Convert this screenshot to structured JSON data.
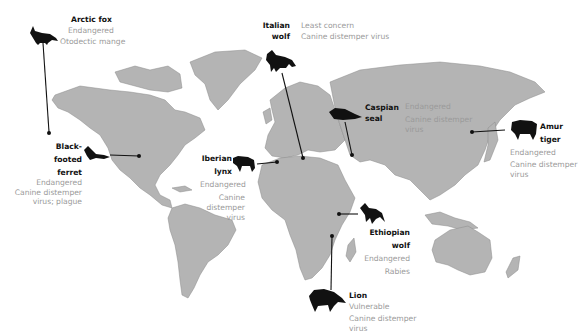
{
  "map": {
    "land_color": "#b4b4b4",
    "border_color": "#8a8a8a",
    "ink_color": "#111111",
    "muted_text_color": "#9a9a9a"
  },
  "species": [
    {
      "id": "arctic-fox",
      "name": "Arctic fox",
      "name_lines": [
        "Arctic fox"
      ],
      "status": "Endangered",
      "disease_lines": [
        "Otodectic mange"
      ],
      "icon": "fox-silhouette-icon"
    },
    {
      "id": "italian-wolf",
      "name": "Italian wolf",
      "name_lines": [
        "Italian",
        "wolf"
      ],
      "status": "Least concern",
      "disease_lines": [
        "Canine distemper virus"
      ],
      "icon": "wolf-silhouette-icon"
    },
    {
      "id": "caspian-seal",
      "name": "Caspian seal",
      "name_lines": [
        "Caspian",
        "seal"
      ],
      "status": "Endangered",
      "disease_lines": [
        "Canine distemper",
        "virus"
      ],
      "icon": "seal-silhouette-icon"
    },
    {
      "id": "amur-tiger",
      "name": "Amur tiger",
      "name_lines": [
        "Amur",
        "tiger"
      ],
      "status": "Endangered",
      "disease_lines": [
        "Canine distemper",
        "virus"
      ],
      "icon": "tiger-silhouette-icon"
    },
    {
      "id": "black-footed-ferret",
      "name": "Black-footed ferret",
      "name_lines": [
        "Black-",
        "footed",
        "ferret"
      ],
      "status": "Endangered",
      "disease_lines": [
        "Canine distemper",
        "virus; plague"
      ],
      "icon": "ferret-silhouette-icon"
    },
    {
      "id": "iberian-lynx",
      "name": "Iberian lynx",
      "name_lines": [
        "Iberian",
        "lynx"
      ],
      "status": "Endangered",
      "disease_lines": [
        "Canine",
        "distemper",
        "virus"
      ],
      "icon": "lynx-silhouette-icon"
    },
    {
      "id": "ethiopian-wolf",
      "name": "Ethiopian wolf",
      "name_lines": [
        "Ethiopian",
        "wolf"
      ],
      "status": "Endangered",
      "disease_lines": [
        "Rabies"
      ],
      "icon": "wolf-silhouette-icon"
    },
    {
      "id": "lion",
      "name": "Lion",
      "name_lines": [
        "Lion"
      ],
      "status": "Vulnerable",
      "disease_lines": [
        "Canine distemper",
        "virus"
      ],
      "icon": "lion-silhouette-icon"
    }
  ]
}
